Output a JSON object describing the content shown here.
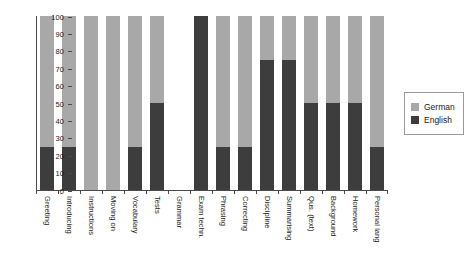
{
  "chart_data": {
    "type": "bar",
    "subtype": "stacked-100-percent",
    "title": "",
    "xlabel": "",
    "ylabel": "",
    "ylim": [
      0,
      100
    ],
    "yticks": [
      0,
      10,
      20,
      30,
      40,
      50,
      60,
      70,
      80,
      90,
      100
    ],
    "grid": false,
    "legend_position": "right",
    "categories": [
      "Greeting",
      "Introducing",
      "Instructions",
      "Moving on",
      "Vocabulary",
      "Tests",
      "Grammar",
      "Exam techn.",
      "Phrasing",
      "Correcting",
      "Discipline",
      "Summarising",
      "Qus. (text)",
      "Background",
      "Homework",
      "Personal lang"
    ],
    "series": [
      {
        "name": "German",
        "color": "#a8a8a8",
        "values": [
          75,
          75,
          100,
          100,
          75,
          50,
          0,
          0,
          75,
          75,
          25,
          25,
          50,
          50,
          50,
          75
        ]
      },
      {
        "name": "English",
        "color": "#3d3d3d",
        "values": [
          25,
          25,
          0,
          0,
          25,
          50,
          0,
          100,
          25,
          25,
          75,
          75,
          50,
          50,
          50,
          25
        ]
      }
    ],
    "empty_categories": [
      "Grammar"
    ]
  },
  "legend": {
    "items": [
      {
        "label": "German",
        "color": "#a8a8a8"
      },
      {
        "label": "English",
        "color": "#3d3d3d"
      }
    ]
  }
}
